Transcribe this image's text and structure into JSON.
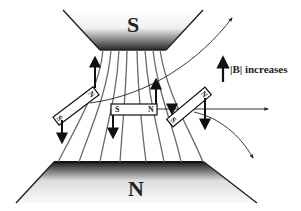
{
  "diagram": {
    "type": "magnetic-field-illustration",
    "poles": {
      "top": {
        "label": "S"
      },
      "bottom": {
        "label": "N"
      }
    },
    "legend": {
      "arrow_meaning": "|B| increases"
    },
    "magnets": [
      {
        "id": "left",
        "end_a": "N",
        "end_b": "S",
        "orientation": "tilted"
      },
      {
        "id": "center",
        "end_a": "S",
        "end_b": "N",
        "orientation": "horizontal"
      },
      {
        "id": "right",
        "end_a": "S",
        "end_b": "N",
        "orientation": "tilted"
      }
    ],
    "field_line_count": 8,
    "colors": {
      "pole_dark": "#333333",
      "pole_light": "#f2f2f2",
      "field_line": "#666666",
      "arrow": "#111111"
    }
  }
}
